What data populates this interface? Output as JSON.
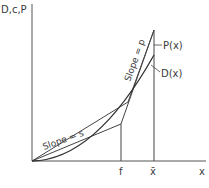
{
  "diagram": {
    "y_axis_label": "D,c,P",
    "x_axis_label": "x",
    "x_ticks": [
      {
        "label": "f"
      },
      {
        "label": "x̄"
      }
    ],
    "curves": {
      "P": {
        "label": "P(x)"
      },
      "D": {
        "label": "D(x)"
      }
    },
    "slopes": {
      "s": {
        "label": "Slope = s"
      },
      "p": {
        "label": "Slope = p"
      }
    },
    "colors": {
      "line": "#444444",
      "text": "#3a3a3a",
      "background": "#ffffff"
    }
  }
}
